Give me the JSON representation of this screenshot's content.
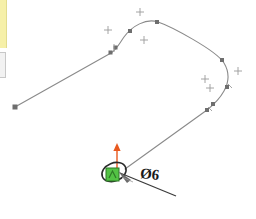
{
  "app": {
    "title": "CAD Sketch Viewport",
    "background_color": "#ffffff"
  },
  "left_panels": [
    {
      "name": "highlighted-panel-edge",
      "color": "#f6f0a8"
    },
    {
      "name": "inactive-panel-edge",
      "color": "#f2f2f2"
    }
  ],
  "sketch": {
    "curve_color": "#8a8a8a",
    "node_color": "#6e6e6e",
    "marker_color": "#9a9a9a",
    "endpoint": {
      "x": 15,
      "y": 107
    },
    "nodes": [
      {
        "x": 15,
        "y": 107
      },
      {
        "x": 111,
        "y": 53
      },
      {
        "x": 116,
        "y": 48
      },
      {
        "x": 130,
        "y": 31
      },
      {
        "x": 157,
        "y": 22
      },
      {
        "x": 222,
        "y": 60
      },
      {
        "x": 227,
        "y": 87
      },
      {
        "x": 213,
        "y": 104
      },
      {
        "x": 207,
        "y": 110
      },
      {
        "x": 125,
        "y": 169
      }
    ],
    "crosshair_markers": [
      {
        "x": 108,
        "y": 30
      },
      {
        "x": 140,
        "y": 12
      },
      {
        "x": 144,
        "y": 40
      },
      {
        "x": 205,
        "y": 79
      },
      {
        "x": 210,
        "y": 88
      },
      {
        "x": 238,
        "y": 71
      }
    ]
  },
  "circle_tool": {
    "name": "circle-preview",
    "center": {
      "x": 114,
      "y": 172
    },
    "radius_x": 12,
    "radius_y": 9,
    "rotation_deg": -22,
    "stroke_color": "#2a2a2a"
  },
  "snap_indicator": {
    "name": "coincident-snap-marker",
    "x": 106,
    "y": 168,
    "size": 13,
    "fill": "#53c244",
    "stroke": "#2f7a27"
  },
  "direction_arrow": {
    "name": "vertical-axis-arrow",
    "x": 117,
    "y_top": 144,
    "y_bottom": 170,
    "color": "#e8591f"
  },
  "dimension": {
    "name": "diameter-dimension",
    "symbol": "Ø",
    "value": "6",
    "label": "Ø6",
    "leader": {
      "from": {
        "x": 117,
        "y": 172
      },
      "to": {
        "x": 176,
        "y": 196
      }
    },
    "arrow_color": "#555555",
    "text_color": "#1a1a1a"
  }
}
